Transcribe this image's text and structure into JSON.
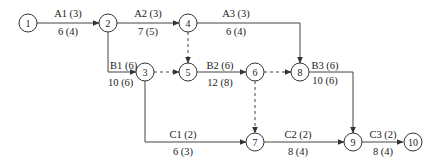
{
  "diagram": {
    "type": "activity-on-arrow network",
    "nodes": [
      {
        "id": "1",
        "x": 28,
        "y": 23
      },
      {
        "id": "2",
        "x": 108,
        "y": 23
      },
      {
        "id": "3",
        "x": 145,
        "y": 72
      },
      {
        "id": "4",
        "x": 188,
        "y": 23
      },
      {
        "id": "5",
        "x": 188,
        "y": 72
      },
      {
        "id": "6",
        "x": 255,
        "y": 72
      },
      {
        "id": "7",
        "x": 255,
        "y": 142
      },
      {
        "id": "8",
        "x": 300,
        "y": 72
      },
      {
        "id": "9",
        "x": 353,
        "y": 142
      },
      {
        "id": "10",
        "x": 413,
        "y": 142
      }
    ],
    "activities": [
      {
        "name": "A1 (3)",
        "duration": "6 (4)",
        "from": "1",
        "to": "2"
      },
      {
        "name": "A2 (3)",
        "duration": "7 (5)",
        "from": "2",
        "to": "4"
      },
      {
        "name": "A3 (3)",
        "duration": "6 (4)",
        "from": "4",
        "to": "8"
      },
      {
        "name": "B1 (6)",
        "duration": "10 (6)",
        "from": "2",
        "to": "3"
      },
      {
        "name": "B2 (6)",
        "duration": "12 (8)",
        "from": "5",
        "to": "6"
      },
      {
        "name": "B3 (6)",
        "duration": "10 (6)",
        "from": "8",
        "to": "9"
      },
      {
        "name": "C1 (2)",
        "duration": "6 (3)",
        "from": "3",
        "to": "7"
      },
      {
        "name": "C2 (2)",
        "duration": "8 (4)",
        "from": "7",
        "to": "9"
      },
      {
        "name": "C3 (2)",
        "duration": "8 (4)",
        "from": "9",
        "to": "10"
      }
    ],
    "dummies": [
      {
        "from": "4",
        "to": "5"
      },
      {
        "from": "3",
        "to": "5"
      },
      {
        "from": "6",
        "to": "8"
      },
      {
        "from": "6",
        "to": "7"
      }
    ]
  }
}
